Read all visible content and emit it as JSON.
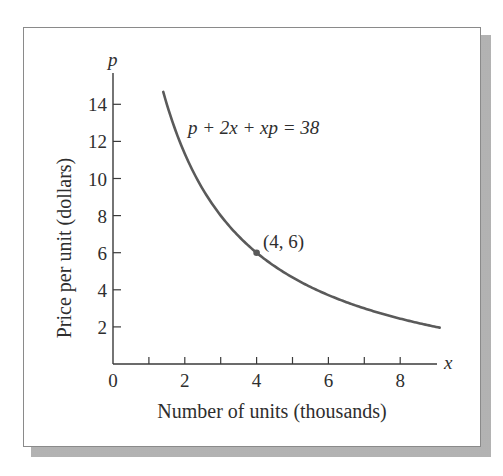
{
  "chart_data": {
    "type": "line",
    "title": "",
    "equation_label": "p + 2x + xp = 38",
    "xlabel": "Number of units (thousands)",
    "ylabel": "Price per unit (dollars)",
    "x_axis_symbol": "x",
    "y_axis_symbol": "p",
    "xlim": [
      0,
      9.2
    ],
    "ylim": [
      0,
      15.5
    ],
    "x_ticks": [
      0,
      1,
      2,
      3,
      4,
      5,
      6,
      7,
      8
    ],
    "x_tick_labels": [
      "0",
      "2",
      "4",
      "6",
      "8"
    ],
    "y_ticks": [
      2,
      4,
      6,
      8,
      10,
      12,
      14
    ],
    "y_tick_labels": [
      "2",
      "4",
      "6",
      "8",
      "10",
      "12",
      "14"
    ],
    "grid": false,
    "legend": "none",
    "series": [
      {
        "name": "p = (38 - 2x) / (1 + x)",
        "x": [
          1.4,
          1.5,
          2,
          2.5,
          3,
          3.5,
          4,
          5,
          6,
          7,
          8,
          9.1
        ],
        "y": [
          14.67,
          14.0,
          11.33,
          9.43,
          8.0,
          6.89,
          6.0,
          4.67,
          3.71,
          3.0,
          2.44,
          1.98
        ]
      }
    ],
    "annotations": [
      {
        "type": "point",
        "x": 4,
        "y": 6,
        "label": "(4, 6)"
      }
    ],
    "colors": {
      "curve": "#5a5a5a",
      "axes": "#3a3a3a",
      "text": "#2e2e2e",
      "frame": "#8a8a8a"
    }
  }
}
